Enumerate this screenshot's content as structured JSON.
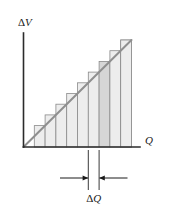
{
  "figure": {
    "title": "",
    "y_axis_label": "ΔV",
    "x_axis_label": "Q",
    "dimension_label": "ΔQ",
    "colors": {
      "axis": "#2b2b2b",
      "bar_fill_light": "#ededed",
      "bar_fill_highlight": "#d6d6d6",
      "bar_stroke": "#8a8a8a",
      "trend_line": "#8f8f8f",
      "marker": "#3a3a3a",
      "background": "#ffffff"
    }
  },
  "chart_data": {
    "type": "bar",
    "title": "",
    "subtitle": "",
    "xlabel": "Q",
    "ylabel": "ΔV",
    "grid": false,
    "legend": "none",
    "xlim": [
      0,
      10
    ],
    "ylim": [
      0,
      10
    ],
    "categories": [
      "1",
      "2",
      "3",
      "4",
      "5",
      "6",
      "7",
      "8",
      "9",
      "10"
    ],
    "values": [
      1,
      2,
      3,
      4,
      5,
      6,
      7,
      8,
      9,
      10
    ],
    "highlight_index": 6,
    "series": [
      {
        "name": "step approximation",
        "type": "bar",
        "values": [
          1,
          2,
          3,
          4,
          5,
          6,
          7,
          8,
          9,
          10
        ]
      },
      {
        "name": "linear relation",
        "type": "line",
        "x": [
          0,
          10
        ],
        "values": [
          0,
          10
        ]
      }
    ],
    "annotations": [
      {
        "name": "delta-q-dimension",
        "label": "ΔQ",
        "x_start": 6,
        "x_end": 7,
        "description": "width of one highlighted strip along Q axis"
      }
    ]
  }
}
